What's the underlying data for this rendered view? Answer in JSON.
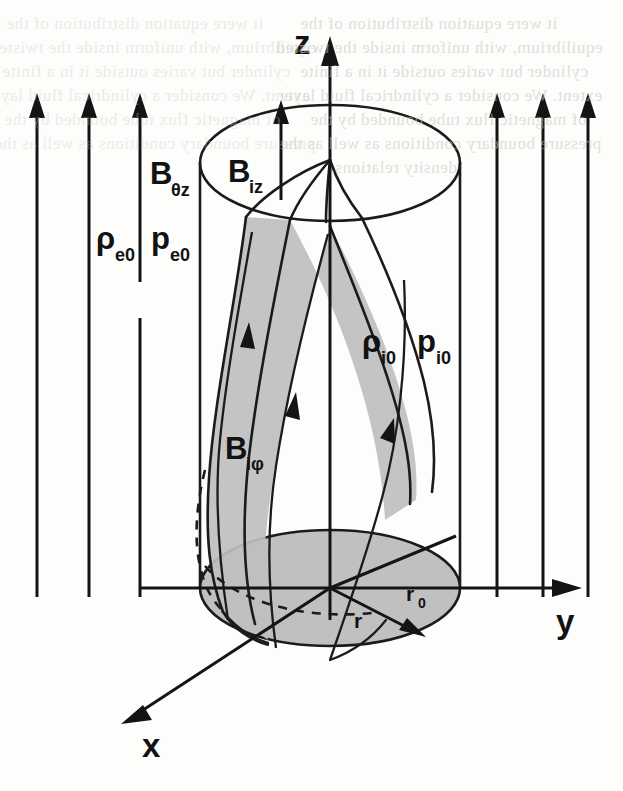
{
  "figure": {
    "background_color": "#fdfdfb",
    "ink_color": "#1b1b1b",
    "shade_color": "#bfbfbf"
  },
  "axes": {
    "z_label": "z",
    "y_label": "y",
    "x_label": "x"
  },
  "labels": {
    "b_ez_base": "B",
    "b_ez_sub": "θz",
    "b_iz_base": "B",
    "b_iz_sub": "iz",
    "b_iphi_base": "B",
    "b_iphi_sub": "iφ",
    "rho_e0_base": "ρ",
    "rho_e0_sub": "e0",
    "p_e0_base": "p",
    "p_e0_sub": "e0",
    "rho_i0_base": "ρ",
    "rho_i0_sub": "i0",
    "p_i0_base": "p",
    "p_i0_sub": "i0",
    "r_label": "r",
    "r0_base": "r",
    "r0_sub": "0"
  },
  "external_field": {
    "description": "External vertical magnetic field arrows",
    "left_arrows_x": [
      37,
      89,
      140
    ],
    "right_arrows_x": [
      497,
      543,
      588
    ],
    "arrow_top_y": 98,
    "arrow_bottom_y": 597,
    "short_arrow_index": 2,
    "short_arrow_bottom_y": 597,
    "short_arrow_stem_top_y": 320
  },
  "cylinder": {
    "left_x": 200,
    "right_x": 460,
    "axis_x": 330,
    "top_ellipse_cy": 163,
    "bottom_ellipse_cy": 588,
    "rx": 130,
    "ry": 58
  },
  "flux_tube": {
    "description": "Twisted internal magnetic flux tube, shaded gray",
    "field_line_count": 3,
    "arrowheads_on_lines": 3
  },
  "ghost_text": {
    "note": "Faint bleed-through text from reverse page",
    "lines": [
      "it were equation distribution of the",
      "equilibrium, with uniform inside the twisted",
      "cylinder but varies outside it in a finite",
      "extent. We consider a cylindrical fluid layer",
      "of magnetic flux tube bounded by the",
      "pressure boundary conditions as well as the",
      "density relations."
    ]
  }
}
